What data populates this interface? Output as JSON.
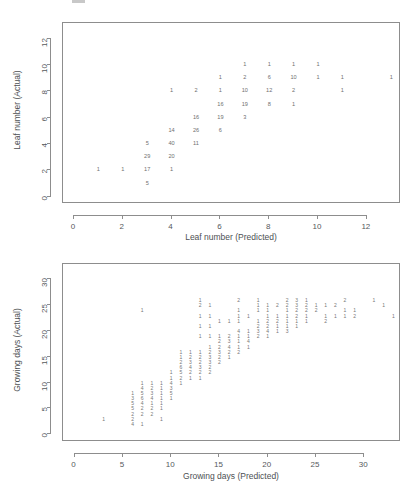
{
  "page": {
    "background": "#ffffff",
    "text_color": "#4a4a4a",
    "axis_color": "#8d8d8d",
    "point_color": "#6f6f6f"
  },
  "chart_data": [
    {
      "id": "leaf-number",
      "type": "scatter",
      "title": "",
      "xlabel": "Leaf number (Predicted)",
      "ylabel": "Leaf number (Actual)",
      "xlim": [
        -0.45,
        13.4
      ],
      "ylim": [
        -0.55,
        13.2
      ],
      "xticks": [
        0,
        2,
        4,
        6,
        8,
        10,
        12
      ],
      "yticks": [
        0,
        2,
        4,
        6,
        8,
        10,
        12
      ],
      "grid": false,
      "legend": "none",
      "point_style": "count-label",
      "note": "Each plotted point is drawn as the count of observations at that predicted/actual pair.",
      "points": [
        {
          "x": 1,
          "y": 2,
          "label": "1"
        },
        {
          "x": 2,
          "y": 2,
          "label": "1"
        },
        {
          "x": 3,
          "y": 1,
          "label": "5"
        },
        {
          "x": 3,
          "y": 2,
          "label": "17"
        },
        {
          "x": 3,
          "y": 3,
          "label": "29"
        },
        {
          "x": 3,
          "y": 4,
          "label": "5"
        },
        {
          "x": 4,
          "y": 2,
          "label": "1"
        },
        {
          "x": 4,
          "y": 3,
          "label": "20"
        },
        {
          "x": 4,
          "y": 4,
          "label": "40"
        },
        {
          "x": 4,
          "y": 5,
          "label": "14"
        },
        {
          "x": 4,
          "y": 8,
          "label": "1"
        },
        {
          "x": 5,
          "y": 4,
          "label": "11"
        },
        {
          "x": 5,
          "y": 5,
          "label": "26"
        },
        {
          "x": 5,
          "y": 6,
          "label": "16"
        },
        {
          "x": 5,
          "y": 8,
          "label": "2"
        },
        {
          "x": 6,
          "y": 5,
          "label": "6"
        },
        {
          "x": 6,
          "y": 6,
          "label": "19"
        },
        {
          "x": 6,
          "y": 7,
          "label": "16"
        },
        {
          "x": 6,
          "y": 8,
          "label": "1"
        },
        {
          "x": 6,
          "y": 9,
          "label": "1"
        },
        {
          "x": 7,
          "y": 6,
          "label": "3"
        },
        {
          "x": 7,
          "y": 7,
          "label": "19"
        },
        {
          "x": 7,
          "y": 8,
          "label": "10"
        },
        {
          "x": 7,
          "y": 9,
          "label": "2"
        },
        {
          "x": 7,
          "y": 10,
          "label": "1"
        },
        {
          "x": 8,
          "y": 7,
          "label": "8"
        },
        {
          "x": 8,
          "y": 8,
          "label": "12"
        },
        {
          "x": 8,
          "y": 9,
          "label": "6"
        },
        {
          "x": 8,
          "y": 10,
          "label": "1"
        },
        {
          "x": 9,
          "y": 7,
          "label": "1"
        },
        {
          "x": 9,
          "y": 8,
          "label": "2"
        },
        {
          "x": 9,
          "y": 9,
          "label": "10"
        },
        {
          "x": 9,
          "y": 10,
          "label": "1"
        },
        {
          "x": 10,
          "y": 9,
          "label": "1"
        },
        {
          "x": 10,
          "y": 10,
          "label": "1"
        },
        {
          "x": 11,
          "y": 8,
          "label": "1"
        },
        {
          "x": 11,
          "y": 9,
          "label": "1"
        },
        {
          "x": 13,
          "y": 9,
          "label": "1"
        }
      ]
    },
    {
      "id": "growing-days",
      "type": "scatter",
      "title": "",
      "xlabel": "Growing days (Predicted)",
      "ylabel": "Growing days (Actual)",
      "xlim": [
        -1.2,
        33.8
      ],
      "ylim": [
        -1.5,
        33.0
      ],
      "xticks": [
        0,
        5,
        10,
        15,
        20,
        25,
        30
      ],
      "yticks": [
        0,
        5,
        10,
        15,
        20,
        25,
        30
      ],
      "grid": false,
      "legend": "none",
      "point_style": "count-label",
      "note": "Each plotted point is drawn as the count of observations at that predicted/actual pair; most counts are 1.",
      "points": [
        {
          "x": 3,
          "y": 3,
          "label": "1"
        },
        {
          "x": 6,
          "y": 2,
          "label": "4"
        },
        {
          "x": 6,
          "y": 3,
          "label": "2"
        },
        {
          "x": 6,
          "y": 4,
          "label": "2"
        },
        {
          "x": 6,
          "y": 5,
          "label": "5"
        },
        {
          "x": 6,
          "y": 6,
          "label": "5"
        },
        {
          "x": 6,
          "y": 7,
          "label": "3"
        },
        {
          "x": 6,
          "y": 8,
          "label": "1"
        },
        {
          "x": 7,
          "y": 2,
          "label": "1"
        },
        {
          "x": 7,
          "y": 4,
          "label": "2"
        },
        {
          "x": 7,
          "y": 5,
          "label": "2"
        },
        {
          "x": 7,
          "y": 6,
          "label": "4"
        },
        {
          "x": 7,
          "y": 7,
          "label": "6"
        },
        {
          "x": 7,
          "y": 8,
          "label": "5"
        },
        {
          "x": 7,
          "y": 9,
          "label": "4"
        },
        {
          "x": 7,
          "y": 10,
          "label": "1"
        },
        {
          "x": 7,
          "y": 24,
          "label": "1"
        },
        {
          "x": 8,
          "y": 4,
          "label": "2"
        },
        {
          "x": 8,
          "y": 5,
          "label": "2"
        },
        {
          "x": 8,
          "y": 6,
          "label": "1"
        },
        {
          "x": 8,
          "y": 7,
          "label": "4"
        },
        {
          "x": 8,
          "y": 8,
          "label": "3"
        },
        {
          "x": 8,
          "y": 9,
          "label": "2"
        },
        {
          "x": 8,
          "y": 10,
          "label": "1"
        },
        {
          "x": 9,
          "y": 3,
          "label": "1"
        },
        {
          "x": 9,
          "y": 5,
          "label": "1"
        },
        {
          "x": 9,
          "y": 6,
          "label": "1"
        },
        {
          "x": 9,
          "y": 7,
          "label": "1"
        },
        {
          "x": 9,
          "y": 8,
          "label": "1"
        },
        {
          "x": 9,
          "y": 9,
          "label": "1"
        },
        {
          "x": 9,
          "y": 10,
          "label": "1"
        },
        {
          "x": 10,
          "y": 7,
          "label": "1"
        },
        {
          "x": 10,
          "y": 8,
          "label": "5"
        },
        {
          "x": 10,
          "y": 9,
          "label": "3"
        },
        {
          "x": 10,
          "y": 10,
          "label": "4"
        },
        {
          "x": 10,
          "y": 11,
          "label": "1"
        },
        {
          "x": 10,
          "y": 12,
          "label": "1"
        },
        {
          "x": 11,
          "y": 10,
          "label": "1"
        },
        {
          "x": 11,
          "y": 11,
          "label": "2"
        },
        {
          "x": 11,
          "y": 12,
          "label": "5"
        },
        {
          "x": 11,
          "y": 13,
          "label": "6"
        },
        {
          "x": 11,
          "y": 14,
          "label": "2"
        },
        {
          "x": 11,
          "y": 15,
          "label": "1"
        },
        {
          "x": 11,
          "y": 16,
          "label": "1"
        },
        {
          "x": 12,
          "y": 11,
          "label": "1"
        },
        {
          "x": 12,
          "y": 12,
          "label": "2"
        },
        {
          "x": 12,
          "y": 13,
          "label": "4"
        },
        {
          "x": 12,
          "y": 14,
          "label": "3"
        },
        {
          "x": 12,
          "y": 15,
          "label": "2"
        },
        {
          "x": 12,
          "y": 16,
          "label": "1"
        },
        {
          "x": 13,
          "y": 11,
          "label": "1"
        },
        {
          "x": 13,
          "y": 12,
          "label": "2"
        },
        {
          "x": 13,
          "y": 13,
          "label": "3"
        },
        {
          "x": 13,
          "y": 14,
          "label": "2"
        },
        {
          "x": 13,
          "y": 15,
          "label": "2"
        },
        {
          "x": 13,
          "y": 16,
          "label": "1"
        },
        {
          "x": 13,
          "y": 19,
          "label": "1"
        },
        {
          "x": 13,
          "y": 21,
          "label": "1"
        },
        {
          "x": 13,
          "y": 23,
          "label": "1"
        },
        {
          "x": 13,
          "y": 25,
          "label": "2"
        },
        {
          "x": 13,
          "y": 26,
          "label": "1"
        },
        {
          "x": 14,
          "y": 12,
          "label": "2"
        },
        {
          "x": 14,
          "y": 13,
          "label": "2"
        },
        {
          "x": 14,
          "y": 14,
          "label": "3"
        },
        {
          "x": 14,
          "y": 15,
          "label": "3"
        },
        {
          "x": 14,
          "y": 16,
          "label": "2"
        },
        {
          "x": 14,
          "y": 17,
          "label": "1"
        },
        {
          "x": 14,
          "y": 19,
          "label": "1"
        },
        {
          "x": 14,
          "y": 21,
          "label": "1"
        },
        {
          "x": 14,
          "y": 23,
          "label": "1"
        },
        {
          "x": 14,
          "y": 25,
          "label": "1"
        },
        {
          "x": 15,
          "y": 14,
          "label": "2"
        },
        {
          "x": 15,
          "y": 15,
          "label": "2"
        },
        {
          "x": 15,
          "y": 16,
          "label": "3"
        },
        {
          "x": 15,
          "y": 17,
          "label": "2"
        },
        {
          "x": 15,
          "y": 18,
          "label": "2"
        },
        {
          "x": 15,
          "y": 19,
          "label": "1"
        },
        {
          "x": 15,
          "y": 22,
          "label": "1"
        },
        {
          "x": 16,
          "y": 15,
          "label": "1"
        },
        {
          "x": 16,
          "y": 16,
          "label": "2"
        },
        {
          "x": 16,
          "y": 17,
          "label": "4"
        },
        {
          "x": 16,
          "y": 18,
          "label": "3"
        },
        {
          "x": 16,
          "y": 19,
          "label": "2"
        },
        {
          "x": 16,
          "y": 22,
          "label": "1"
        },
        {
          "x": 17,
          "y": 16,
          "label": "2"
        },
        {
          "x": 17,
          "y": 17,
          "label": "1"
        },
        {
          "x": 17,
          "y": 18,
          "label": "1"
        },
        {
          "x": 17,
          "y": 19,
          "label": "1"
        },
        {
          "x": 17,
          "y": 20,
          "label": "4"
        },
        {
          "x": 17,
          "y": 22,
          "label": "1"
        },
        {
          "x": 17,
          "y": 23,
          "label": "1"
        },
        {
          "x": 17,
          "y": 24,
          "label": "1"
        },
        {
          "x": 17,
          "y": 26,
          "label": "2"
        },
        {
          "x": 18,
          "y": 17,
          "label": "1"
        },
        {
          "x": 18,
          "y": 18,
          "label": "4"
        },
        {
          "x": 18,
          "y": 19,
          "label": "1"
        },
        {
          "x": 18,
          "y": 20,
          "label": "1"
        },
        {
          "x": 18,
          "y": 23,
          "label": "1"
        },
        {
          "x": 19,
          "y": 19,
          "label": "2"
        },
        {
          "x": 19,
          "y": 20,
          "label": "3"
        },
        {
          "x": 19,
          "y": 21,
          "label": "2"
        },
        {
          "x": 19,
          "y": 22,
          "label": "1"
        },
        {
          "x": 19,
          "y": 24,
          "label": "1"
        },
        {
          "x": 19,
          "y": 25,
          "label": "1"
        },
        {
          "x": 19,
          "y": 26,
          "label": "1"
        },
        {
          "x": 20,
          "y": 19,
          "label": "1"
        },
        {
          "x": 20,
          "y": 20,
          "label": "4"
        },
        {
          "x": 20,
          "y": 21,
          "label": "2"
        },
        {
          "x": 20,
          "y": 22,
          "label": "2"
        },
        {
          "x": 20,
          "y": 23,
          "label": "1"
        },
        {
          "x": 20,
          "y": 24,
          "label": "1"
        },
        {
          "x": 20,
          "y": 25,
          "label": "1"
        },
        {
          "x": 21,
          "y": 20,
          "label": "1"
        },
        {
          "x": 21,
          "y": 21,
          "label": "1"
        },
        {
          "x": 21,
          "y": 22,
          "label": "2"
        },
        {
          "x": 21,
          "y": 23,
          "label": "1"
        },
        {
          "x": 21,
          "y": 25,
          "label": "2"
        },
        {
          "x": 22,
          "y": 20,
          "label": "3"
        },
        {
          "x": 22,
          "y": 21,
          "label": "1"
        },
        {
          "x": 22,
          "y": 22,
          "label": "1"
        },
        {
          "x": 22,
          "y": 23,
          "label": "1"
        },
        {
          "x": 22,
          "y": 24,
          "label": "1"
        },
        {
          "x": 22,
          "y": 25,
          "label": "2"
        },
        {
          "x": 22,
          "y": 26,
          "label": "2"
        },
        {
          "x": 23,
          "y": 21,
          "label": "1"
        },
        {
          "x": 23,
          "y": 22,
          "label": "1"
        },
        {
          "x": 23,
          "y": 23,
          "label": "2"
        },
        {
          "x": 23,
          "y": 24,
          "label": "2"
        },
        {
          "x": 23,
          "y": 25,
          "label": "3"
        },
        {
          "x": 23,
          "y": 26,
          "label": "3"
        },
        {
          "x": 24,
          "y": 22,
          "label": "1"
        },
        {
          "x": 24,
          "y": 23,
          "label": "1"
        },
        {
          "x": 24,
          "y": 24,
          "label": "2"
        },
        {
          "x": 24,
          "y": 25,
          "label": "2"
        },
        {
          "x": 24,
          "y": 26,
          "label": "1"
        },
        {
          "x": 25,
          "y": 24,
          "label": "2"
        },
        {
          "x": 25,
          "y": 25,
          "label": "1"
        },
        {
          "x": 26,
          "y": 22,
          "label": "2"
        },
        {
          "x": 26,
          "y": 23,
          "label": "1"
        },
        {
          "x": 26,
          "y": 25,
          "label": "1"
        },
        {
          "x": 27,
          "y": 23,
          "label": "1"
        },
        {
          "x": 27,
          "y": 25,
          "label": "2"
        },
        {
          "x": 28,
          "y": 23,
          "label": "1"
        },
        {
          "x": 28,
          "y": 24,
          "label": "1"
        },
        {
          "x": 28,
          "y": 26,
          "label": "2"
        },
        {
          "x": 29,
          "y": 23,
          "label": "2"
        },
        {
          "x": 29,
          "y": 24,
          "label": "1"
        },
        {
          "x": 31,
          "y": 26,
          "label": "1"
        },
        {
          "x": 32,
          "y": 25,
          "label": "1"
        },
        {
          "x": 33,
          "y": 23,
          "label": "1"
        }
      ]
    }
  ]
}
